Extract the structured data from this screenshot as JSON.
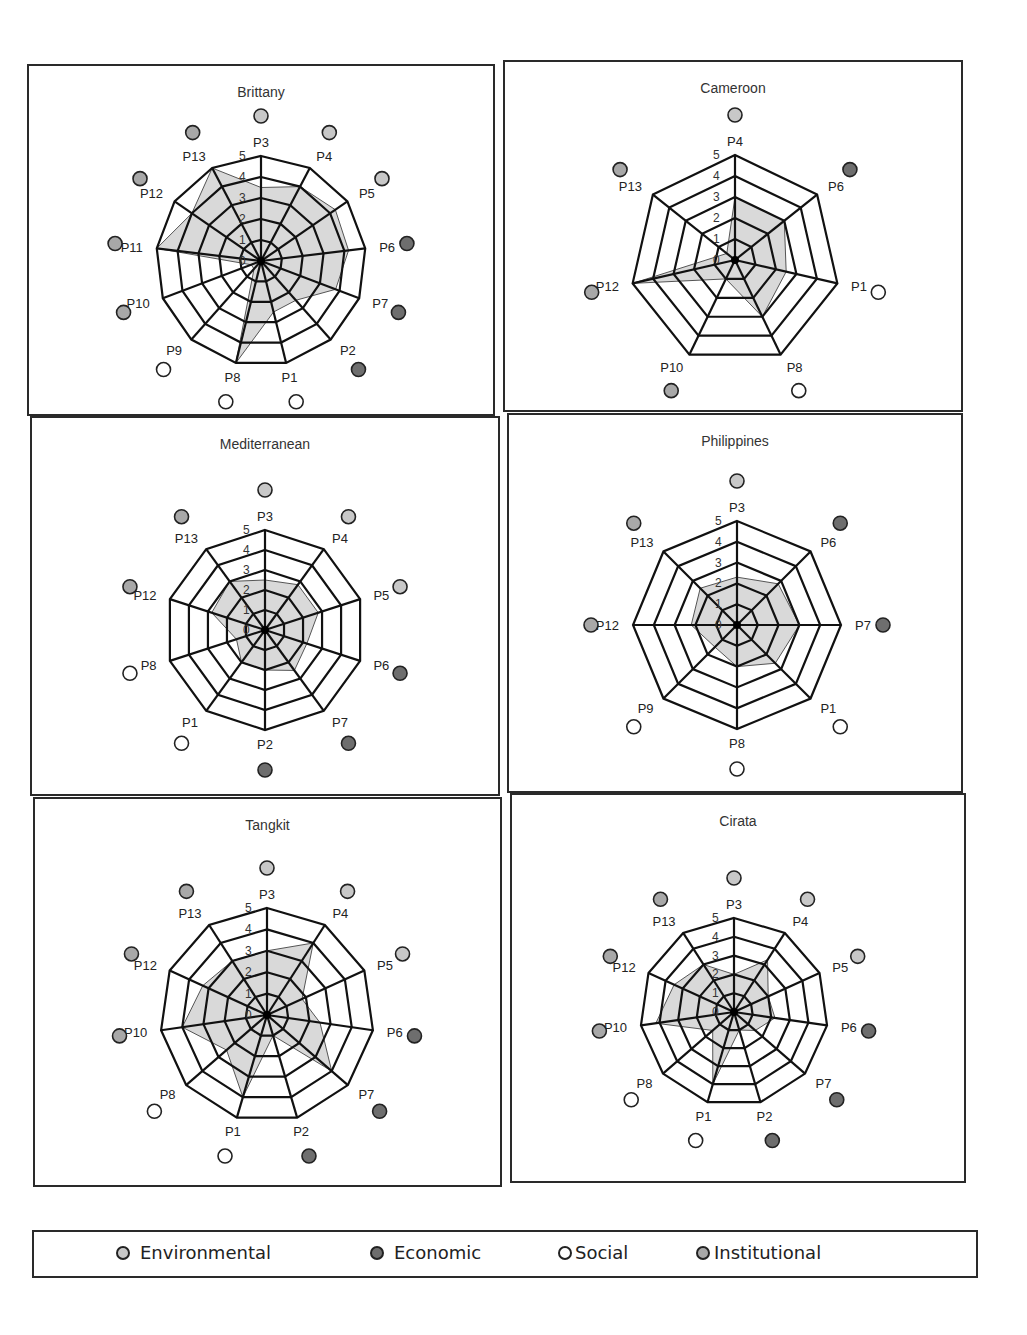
{
  "colors": {
    "environmental": "#c8c8c8",
    "economic": "#6e6e6e",
    "social": "#ffffff",
    "institutional": "#a8a8a8",
    "fill": "#d9d9d9",
    "grid": "#111111"
  },
  "legend": {
    "items": [
      {
        "key": "environmental",
        "label": "Environmental"
      },
      {
        "key": "economic",
        "label": "Economic"
      },
      {
        "key": "social",
        "label": "Social"
      },
      {
        "key": "institutional",
        "label": "Institutional"
      }
    ]
  },
  "chart_data": [
    {
      "type": "radar",
      "title": "Brittany",
      "rlim": [
        0,
        5
      ],
      "ticks": [
        "0",
        "1",
        "2",
        "3",
        "4",
        "5"
      ],
      "axes": [
        "P3",
        "P4",
        "P5",
        "P6",
        "P7",
        "P2",
        "P1",
        "P8",
        "P9",
        "P10",
        "P11",
        "P12",
        "P13"
      ],
      "categories": [
        "environmental",
        "environmental",
        "environmental",
        "economic",
        "economic",
        "economic",
        "social",
        "social",
        "social",
        "institutional",
        "institutional",
        "institutional",
        "institutional"
      ],
      "values": [
        3.5,
        4,
        4.3,
        4.2,
        3.8,
        2.5,
        2.5,
        5,
        0.5,
        0.5,
        5,
        4,
        5
      ]
    },
    {
      "type": "radar",
      "title": "Cameroon",
      "rlim": [
        0,
        5
      ],
      "ticks": [
        "0",
        "1",
        "2",
        "3",
        "4",
        "5"
      ],
      "axes": [
        "P4",
        "P6",
        "P1",
        "P8",
        "P10",
        "P12",
        "P13"
      ],
      "categories": [
        "environmental",
        "economic",
        "social",
        "social",
        "institutional",
        "institutional",
        "institutional"
      ],
      "values": [
        3,
        3,
        2.5,
        3,
        1,
        5,
        0.5
      ]
    },
    {
      "type": "radar",
      "title": "Mediterranean",
      "rlim": [
        0,
        5
      ],
      "ticks": [
        "0",
        "1",
        "2",
        "3",
        "4",
        "5"
      ],
      "axes": [
        "P3",
        "P4",
        "P5",
        "P6",
        "P7",
        "P2",
        "P1",
        "P8",
        "P12",
        "P13"
      ],
      "categories": [
        "environmental",
        "environmental",
        "environmental",
        "economic",
        "economic",
        "economic",
        "social",
        "social",
        "institutional",
        "institutional"
      ],
      "values": [
        2.5,
        2.8,
        2.8,
        2.2,
        2.5,
        2,
        2,
        1.5,
        2.8,
        3
      ]
    },
    {
      "type": "radar",
      "title": "Philippines",
      "rlim": [
        0,
        5
      ],
      "ticks": [
        "0",
        "1",
        "2",
        "3",
        "4",
        "5"
      ],
      "axes": [
        "P3",
        "P6",
        "P7",
        "P1",
        "P8",
        "P9",
        "P12",
        "P13"
      ],
      "categories": [
        "environmental",
        "economic",
        "economic",
        "social",
        "social",
        "social",
        "institutional",
        "institutional"
      ],
      "values": [
        2.3,
        2.8,
        3,
        2.6,
        2,
        1.5,
        2.2,
        2.5
      ]
    },
    {
      "type": "radar",
      "title": "Tangkit",
      "rlim": [
        0,
        5
      ],
      "ticks": [
        "0",
        "1",
        "2",
        "3",
        "4",
        "5"
      ],
      "axes": [
        "P3",
        "P4",
        "P5",
        "P6",
        "P7",
        "P2",
        "P1",
        "P8",
        "P10",
        "P12",
        "P13"
      ],
      "categories": [
        "environmental",
        "environmental",
        "environmental",
        "economic",
        "economic",
        "economic",
        "social",
        "social",
        "institutional",
        "institutional",
        "institutional"
      ],
      "values": [
        3,
        4,
        1.8,
        2.5,
        4,
        1,
        4,
        2.5,
        4,
        3.3,
        3
      ]
    },
    {
      "type": "radar",
      "title": "Cirata",
      "rlim": [
        0,
        5
      ],
      "ticks": [
        "0",
        "1",
        "2",
        "3",
        "4",
        "5"
      ],
      "axes": [
        "P3",
        "P4",
        "P5",
        "P6",
        "P7",
        "P2",
        "P1",
        "P8",
        "P10",
        "P12",
        "P13"
      ],
      "categories": [
        "environmental",
        "environmental",
        "environmental",
        "economic",
        "economic",
        "economic",
        "social",
        "social",
        "institutional",
        "institutional",
        "institutional"
      ],
      "values": [
        2,
        3.3,
        2,
        2.2,
        1.5,
        1,
        4,
        1.5,
        4.2,
        3.5,
        3
      ]
    }
  ]
}
